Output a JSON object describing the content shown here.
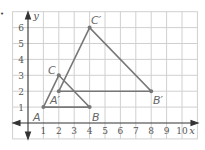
{
  "bullet": "•",
  "graph": {
    "x_axis_label": "x",
    "y_axis_label": "y",
    "x_ticks": [
      "1",
      "2",
      "3",
      "4",
      "5",
      "6",
      "7",
      "8",
      "9",
      "10"
    ],
    "y_ticks": [
      "1",
      "2",
      "3",
      "4",
      "5",
      "6"
    ],
    "grid_x_range": [
      -1,
      11
    ],
    "grid_y_range": [
      -1,
      7
    ],
    "line_color": "#777777",
    "grid_color": "#d0d0d0"
  },
  "triangles": [
    {
      "name": "ABC",
      "vertices": [
        {
          "label": "A",
          "x": 1,
          "y": 1
        },
        {
          "label": "B",
          "x": 4,
          "y": 1
        },
        {
          "label": "C",
          "x": 2,
          "y": 3
        }
      ]
    },
    {
      "name": "A'B'C'",
      "vertices": [
        {
          "label": "A′",
          "x": 2,
          "y": 2
        },
        {
          "label": "B′",
          "x": 8,
          "y": 2
        },
        {
          "label": "C′",
          "x": 4,
          "y": 6
        }
      ]
    }
  ]
}
